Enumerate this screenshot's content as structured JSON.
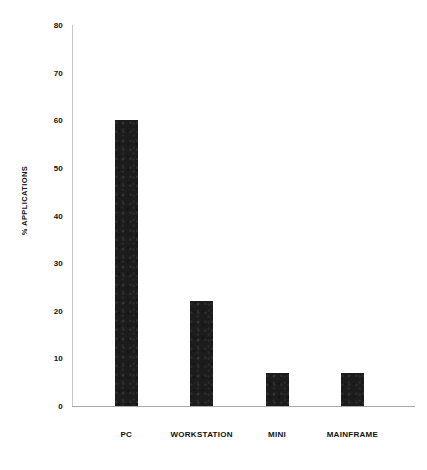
{
  "chart_data": {
    "type": "bar",
    "title": "",
    "subtitle": "",
    "xlabel": "",
    "ylabel": "% APPLICATIONS",
    "categories": [
      "PC",
      "WORKSTATION",
      "MINI",
      "MAINFRAME"
    ],
    "values": [
      60,
      22,
      7,
      7
    ],
    "series": [
      {
        "name": "% Applications",
        "values": [
          60,
          22,
          7,
          7
        ]
      }
    ],
    "ylim": [
      0,
      80
    ],
    "yticks": [
      0,
      10,
      20,
      30,
      40,
      50,
      60,
      70,
      80
    ],
    "ytick_labels": [
      "0",
      "10",
      "20",
      "30",
      "40",
      "50",
      "60",
      "70",
      "80"
    ],
    "grid": false,
    "legend": false,
    "legend_position": "none",
    "bar_color": "#1c1c1c",
    "axis_color": "#b4b4b4",
    "background_color": "#ffffff",
    "annotations": []
  }
}
